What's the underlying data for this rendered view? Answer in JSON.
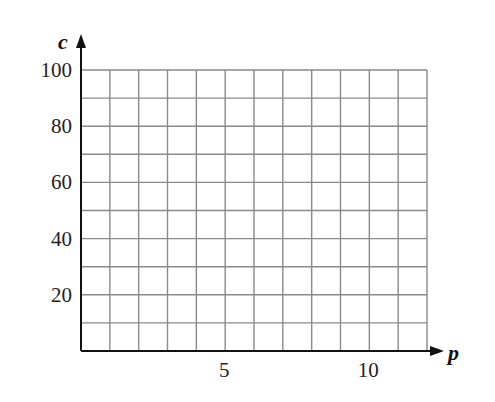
{
  "chart_data": {
    "type": "scatter",
    "title": "",
    "xlabel": "p",
    "ylabel": "c",
    "xlim": [
      0,
      12
    ],
    "ylim": [
      0,
      100
    ],
    "x_ticks": [
      5,
      10
    ],
    "x_tick_labels": [
      "5",
      "10"
    ],
    "y_ticks": [
      20,
      40,
      60,
      80,
      100
    ],
    "y_tick_labels": [
      "20",
      "40",
      "60",
      "80",
      "100"
    ],
    "grid": true,
    "grid_x_step": 1,
    "grid_y_step": 10,
    "series": [],
    "legend": null
  },
  "colors": {
    "grid": "#8a8a8a",
    "axis": "#111111",
    "text": "#222222"
  }
}
